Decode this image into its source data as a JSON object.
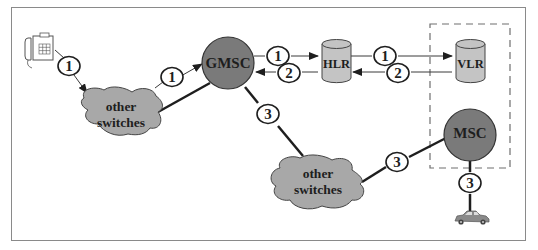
{
  "colors": {
    "frame": "#8a8a8a",
    "switch_fill": "#7a7a7a",
    "cloud_fill": "#a8a8a8",
    "db_fill": "#c4c4c4",
    "line": "#1e1e1e",
    "thin_line": "#3a3a3a",
    "dash": "#6e6e6e"
  },
  "nodes": {
    "gmsc": {
      "label": "GMSC"
    },
    "msc": {
      "label": "MSC"
    },
    "hlr": {
      "label": "HLR"
    },
    "vlr": {
      "label": "VLR"
    },
    "cloud_left": {
      "line1": "other",
      "line2": "switches"
    },
    "cloud_center": {
      "line1": "other",
      "line2": "switches"
    },
    "telephone": {
      "icon": "telephone-icon"
    },
    "car": {
      "icon": "car-icon"
    }
  },
  "step_labels": {
    "phone_to_cloud": "1",
    "cloud_to_gmsc": "1",
    "gmsc_to_hlr": "1",
    "hlr_to_vlr": "1",
    "vlr_to_hlr": "2",
    "hlr_to_gmsc": "2",
    "gmsc_to_cloud": "3",
    "cloud_to_msc": "3",
    "msc_to_car": "3"
  }
}
